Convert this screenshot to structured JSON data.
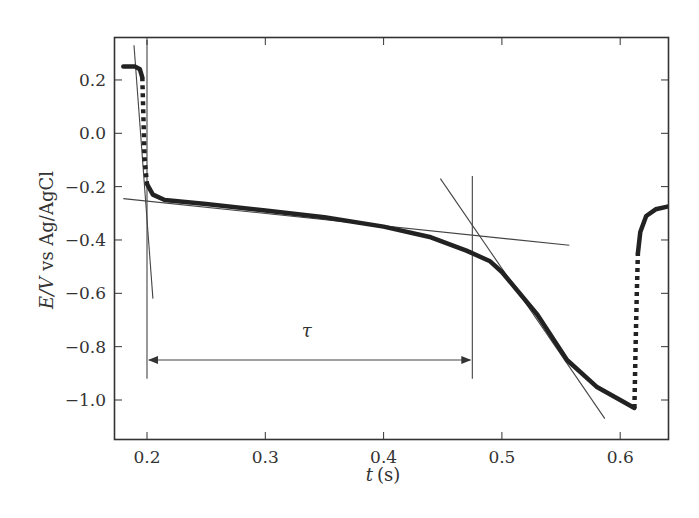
{
  "chart_data": {
    "type": "line",
    "title": "",
    "xlabel": "t (s)",
    "xlabel_italic": "t",
    "xlabel_unit": "(s)",
    "ylabel": "E/V vs Ag/AgCl",
    "ylabel_italic": "E/V",
    "ylabel_rest": "vs Ag/AgCl",
    "xlim": [
      0.175,
      0.64
    ],
    "ylim": [
      -1.15,
      0.35
    ],
    "x_ticks": [
      0.2,
      0.3,
      0.4,
      0.5,
      0.6
    ],
    "x_tick_labels": [
      "0.2",
      "0.3",
      "0.4",
      "0.5",
      "0.6"
    ],
    "y_ticks": [
      0.2,
      0.0,
      -0.2,
      -0.4,
      -0.6,
      -0.8,
      -1.0
    ],
    "y_tick_labels": [
      "0.2",
      "0.0",
      "-0.2",
      "-0.4",
      "-0.6",
      "-0.8",
      "-1.0"
    ],
    "grid": false,
    "legend": null,
    "series": [
      {
        "name": "chronopotentiogram",
        "style": "thick solid",
        "x": [
          0.18,
          0.19,
          0.194,
          0.196
        ],
        "y": [
          0.25,
          0.25,
          0.24,
          0.21
        ]
      },
      {
        "name": "initial potential jump",
        "style": "dotted",
        "x": [
          0.196,
          0.197,
          0.198,
          0.2
        ],
        "y": [
          0.21,
          0.05,
          -0.1,
          -0.19
        ]
      },
      {
        "name": "transition plateau",
        "style": "thick solid",
        "x": [
          0.2,
          0.205,
          0.215,
          0.25,
          0.3,
          0.35,
          0.4,
          0.44,
          0.47,
          0.49,
          0.5,
          0.53,
          0.555,
          0.58,
          0.6,
          0.612
        ],
        "y": [
          -0.19,
          -0.23,
          -0.25,
          -0.265,
          -0.29,
          -0.315,
          -0.35,
          -0.39,
          -0.44,
          -0.48,
          -0.52,
          -0.68,
          -0.85,
          -0.95,
          -1.0,
          -1.03
        ]
      },
      {
        "name": "current reversal jump",
        "style": "dotted",
        "x": [
          0.612,
          0.613,
          0.614,
          0.615
        ],
        "y": [
          -1.03,
          -0.8,
          -0.6,
          -0.45
        ]
      },
      {
        "name": "recovery",
        "style": "thick solid",
        "x": [
          0.615,
          0.617,
          0.622,
          0.63,
          0.64
        ],
        "y": [
          -0.45,
          -0.37,
          -0.31,
          -0.285,
          -0.275
        ]
      }
    ],
    "tangent_lines": [
      {
        "name": "initial-drop tangent",
        "x": [
          0.189,
          0.205
        ],
        "y": [
          0.33,
          -0.62
        ]
      },
      {
        "name": "plateau tangent",
        "x": [
          0.18,
          0.557
        ],
        "y": [
          -0.245,
          -0.42
        ]
      },
      {
        "name": "transition tangent",
        "x": [
          0.448,
          0.587
        ],
        "y": [
          -0.17,
          -1.07
        ]
      }
    ],
    "vertical_lines": [
      {
        "name": "start marker",
        "x": 0.2,
        "y": [
          0.35,
          -0.92
        ]
      },
      {
        "name": "transition time marker",
        "x": 0.475,
        "y": [
          -0.16,
          -0.92
        ]
      }
    ],
    "annotations": [
      {
        "text": "τ",
        "kind": "transition time",
        "arrow_from": 0.2,
        "arrow_to": 0.475,
        "y": -0.85,
        "label_x": 0.335,
        "label_y": -0.74
      }
    ]
  }
}
